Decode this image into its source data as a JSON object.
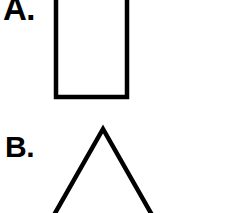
{
  "page": {
    "width": 242,
    "height": 213,
    "background_color": "#ffffff",
    "stroke_color": "#000000"
  },
  "figures": [
    {
      "id": "a",
      "label": "A.",
      "shape_name": "rectangle",
      "stroke_width": 4,
      "clipped": "top",
      "geometry": {
        "left": 54,
        "right": 129,
        "top": -14,
        "bottom": 99,
        "width": 75,
        "visible_height": 99
      }
    },
    {
      "id": "b",
      "label": "B.",
      "shape_name": "triangle",
      "stroke_width": 4,
      "clipped": "bottom",
      "geometry": {
        "apex_x": 103,
        "apex_y": 128,
        "left_leg_end_x": 54,
        "left_leg_end_y": 215,
        "right_leg_end_x": 152,
        "right_leg_end_y": 215
      }
    }
  ]
}
